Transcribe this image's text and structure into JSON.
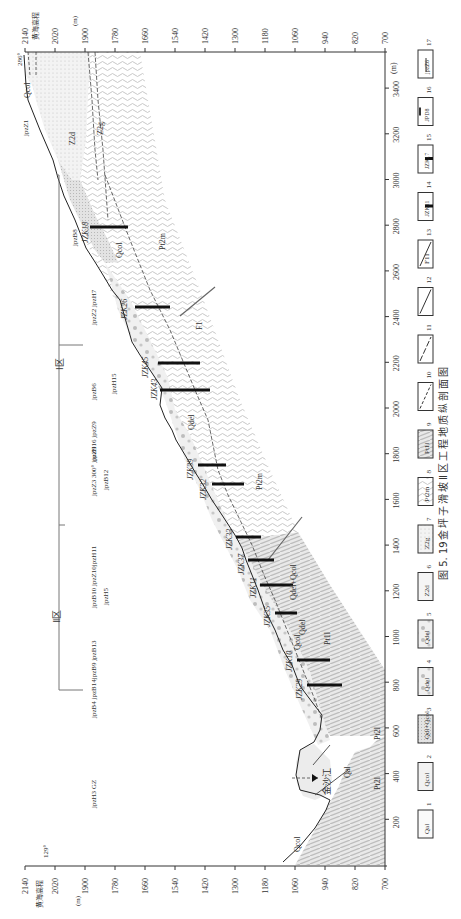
{
  "figure": {
    "caption_number": "图 5. 19",
    "caption_title": "金坪子滑坡Ⅱ区工程地质纵剖面图",
    "orientation": "rotated 90° counter-clockwise"
  },
  "axes": {
    "elevation_label": "黄海高程",
    "elevation_unit": "(m)",
    "distance_unit": "(m)",
    "elevation_ticks": [
      "2140",
      "2020",
      "1900",
      "1780",
      "1660",
      "1540",
      "1420",
      "1300",
      "1180",
      "1060",
      "940",
      "820",
      "700"
    ],
    "distance_ticks": [
      "200",
      "400",
      "600",
      "800",
      "1000",
      "1200",
      "1400",
      "1600",
      "1800",
      "2000",
      "2200",
      "2400",
      "2600",
      "2800",
      "3000",
      "3200",
      "3400"
    ],
    "left_top_value": "129°",
    "right_top_value": "286°"
  },
  "zones": {
    "zone1_label": "Ⅰ区",
    "zone2_label": "Ⅱ区"
  },
  "river": {
    "label": "金沙江"
  },
  "strata_labels": [
    {
      "text": "Qcol",
      "d": 60,
      "e": 1040
    },
    {
      "text": "Qal",
      "d": 400,
      "e": 790
    },
    {
      "text": "Pt2l",
      "d": 330,
      "e": 730
    },
    {
      "text": "Pt2l",
      "d": 560,
      "e": 730
    },
    {
      "text": "Pt1l",
      "d": 990,
      "e": 870
    },
    {
      "text": "Qdel",
      "d": 1000,
      "e": 940
    },
    {
      "text": "Qcol",
      "d": 920,
      "e": 960
    },
    {
      "text": "Qdel+Qcol",
      "d": 1150,
      "e": 930
    },
    {
      "text": "Qdel",
      "d": 1920,
      "e": 1280
    },
    {
      "text": "Pt2m",
      "d": 1680,
      "e": 1150
    },
    {
      "text": "F1",
      "d": 2340,
      "e": 1340
    },
    {
      "text": "Pt2m",
      "d": 2700,
      "e": 1570
    },
    {
      "text": "Qcol",
      "d": 2700,
      "e": 1680
    },
    {
      "text": "Z2d",
      "d": 3250,
      "e": 1920
    },
    {
      "text": "Z2g",
      "d": 3250,
      "e": 1750
    },
    {
      "text": "Qcol",
      "d": 3400,
      "e": 2050
    }
  ],
  "boreholes": [
    {
      "id": "JZK29",
      "d": 790
    },
    {
      "id": "JZK10",
      "d": 910
    },
    {
      "id": "JZK35",
      "d": 1110
    },
    {
      "id": "JZK11",
      "d": 1230
    },
    {
      "id": "JZK37",
      "d": 1330
    },
    {
      "id": "JZK33",
      "d": 1440
    },
    {
      "id": "JZK32",
      "d": 1670
    },
    {
      "id": "JZK39",
      "d": 1780
    },
    {
      "id": "JZK43",
      "d": 2080
    },
    {
      "id": "JZK45",
      "d": 2200
    },
    {
      "id": "JZK26",
      "d": 2450
    },
    {
      "id": "JZK18",
      "d": 2800
    }
  ],
  "surface_markers": [
    {
      "label": "jpzH3 GZ",
      "d": 360
    },
    {
      "label": "jpzB4 jpzB14jpzB9 jpzB13",
      "d": 840
    },
    {
      "label": "jpzB10 jpzZ10jpzH11",
      "d": 1230
    },
    {
      "label": "jpzH5",
      "d": 1190
    },
    {
      "label": "jpzZ3 300° jpzZ9",
      "d": 1740
    },
    {
      "label": "jpzB12",
      "d": 1720
    },
    {
      "label": "jpzH16 jpzZ9",
      "d": 1870
    },
    {
      "label": "jpzB6",
      "d": 2080
    },
    {
      "label": "jpzH15",
      "d": 2160
    },
    {
      "label": "jpzZ2 jpzH7",
      "d": 2440
    },
    {
      "label": "jpzB8",
      "d": 2800
    },
    {
      "label": "jpzZ1",
      "d": 3290
    }
  ],
  "legend": [
    {
      "n": "1",
      "text": "Qal"
    },
    {
      "n": "2",
      "text": "Qcol"
    },
    {
      "n": "3",
      "text": "Qdl+Qcol"
    },
    {
      "n": "4",
      "text": "Qdel"
    },
    {
      "n": "5",
      "text": "Qdel"
    },
    {
      "n": "6",
      "text": "Z2d"
    },
    {
      "n": "7",
      "text": "Z2g"
    },
    {
      "n": "8",
      "text": "Pt2m"
    },
    {
      "n": "9",
      "text": "Pt1l"
    },
    {
      "n": "10",
      "text": ""
    },
    {
      "n": "11",
      "text": ""
    },
    {
      "n": "12",
      "text": ""
    },
    {
      "n": "13",
      "text": "F11"
    },
    {
      "n": "14",
      "text": "JZK11"
    },
    {
      "n": "15",
      "text": "JZK17"
    },
    {
      "n": "16",
      "text": "JPD8"
    },
    {
      "n": "17",
      "text": "jpzZ6"
    }
  ]
}
